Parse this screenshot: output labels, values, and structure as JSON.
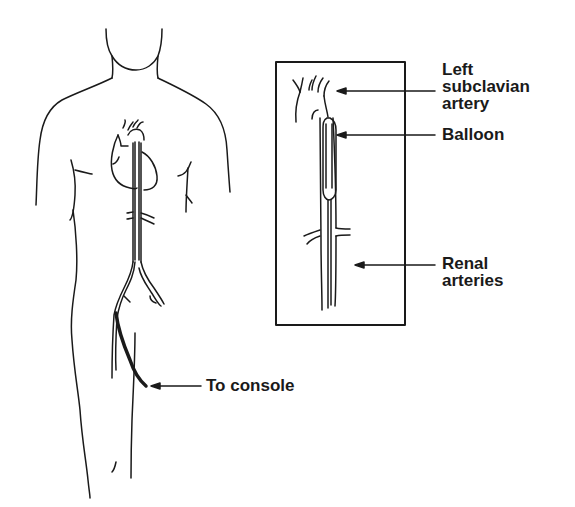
{
  "figure": {
    "colors": {
      "line": "#1a1a1a",
      "background": "#ffffff"
    }
  },
  "labels": {
    "left_subclavian": "Left\nsubclavian\nartery",
    "balloon": "Balloon",
    "renal_arteries": "Renal\narteries",
    "to_console": "To console"
  }
}
